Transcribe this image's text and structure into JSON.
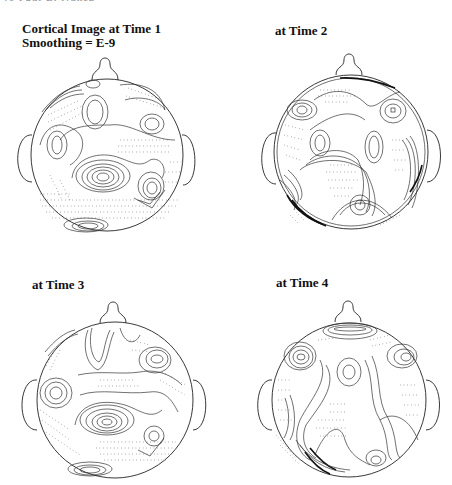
{
  "page": {
    "running_header": "46      Paul L. Nunez"
  },
  "figure": {
    "panels": [
      {
        "id": "time1",
        "title_line1": "Cortical Image at Time 1",
        "title_line2": "Smoothing = E-9"
      },
      {
        "id": "time2",
        "title_line1": "at Time 2"
      },
      {
        "id": "time3",
        "title_line1": "at Time 3"
      },
      {
        "id": "time4",
        "title_line1": "at Time 4"
      }
    ],
    "content_type": "scalp contour maps (head outline with nose and ears), solid and dotted contour lines"
  }
}
